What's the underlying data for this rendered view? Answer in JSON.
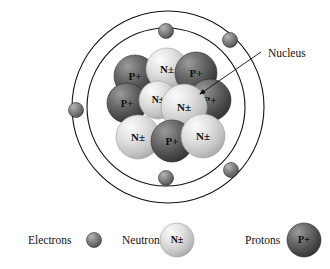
{
  "figure": {
    "background_color": "#ffffff",
    "ring_stroke_color": "#111111"
  },
  "annotations": {
    "nucleus_label": "Nucleus"
  },
  "colors": {
    "proton_light": "#8d8d8d",
    "proton_mid": "#636363",
    "proton_dark": "#3d3d3d",
    "neutron_light": "#f0f0f0",
    "neutron_mid": "#cfcfcf",
    "neutron_dark": "#9a9a9a",
    "electron_light": "#a8a8a8",
    "electron_mid": "#7c7c7c",
    "electron_dark": "#4a4a4a",
    "text": "#111111"
  },
  "orbits": [
    {
      "name": "outer-orbit",
      "cx": 168,
      "cy": 107,
      "r": 96
    },
    {
      "name": "inner-orbit",
      "cx": 166,
      "cy": 107,
      "r": 79
    }
  ],
  "electrons": [
    {
      "name": "electron-top-inner",
      "cx": 166,
      "cy": 31,
      "r": 7.5
    },
    {
      "name": "electron-top-right-outer",
      "cx": 230,
      "cy": 40,
      "r": 7.5
    },
    {
      "name": "electron-left-outer",
      "cx": 76,
      "cy": 110,
      "r": 7.5
    },
    {
      "name": "electron-bottom-inner",
      "cx": 166,
      "cy": 178,
      "r": 7.5
    },
    {
      "name": "electron-bottom-right-outer",
      "cx": 231,
      "cy": 170,
      "r": 7.5
    }
  ],
  "nucleus": {
    "particles": [
      {
        "name": "proton-1",
        "type": "proton",
        "label": "P+",
        "cx": 135,
        "cy": 76,
        "r": 21
      },
      {
        "name": "neutron-1",
        "type": "neutron",
        "label": "N±",
        "cx": 167,
        "cy": 69,
        "r": 21
      },
      {
        "name": "proton-2",
        "type": "proton",
        "label": "P+",
        "cx": 196,
        "cy": 73,
        "r": 21
      },
      {
        "name": "proton-3",
        "type": "proton",
        "label": "P+",
        "cx": 127,
        "cy": 103,
        "r": 20
      },
      {
        "name": "neutron-2",
        "type": "neutron",
        "label": "N±",
        "cx": 158,
        "cy": 100,
        "r": 19
      },
      {
        "name": "proton-4",
        "type": "proton",
        "label": "P+",
        "cx": 210,
        "cy": 100,
        "r": 21
      },
      {
        "name": "neutron-3",
        "type": "neutron",
        "label": "N±",
        "cx": 184,
        "cy": 107,
        "r": 23
      },
      {
        "name": "neutron-4",
        "type": "neutron",
        "label": "N±",
        "cx": 138,
        "cy": 137,
        "r": 22
      },
      {
        "name": "proton-5",
        "type": "proton",
        "label": "P+",
        "cx": 172,
        "cy": 141,
        "r": 21
      },
      {
        "name": "neutron-5",
        "type": "neutron",
        "label": "N±",
        "cx": 203,
        "cy": 136,
        "r": 22
      }
    ],
    "proton_count": 5,
    "neutron_count": 5
  },
  "leader_line": {
    "name": "nucleus-leader-line",
    "x1": 261,
    "y1": 52,
    "x2": 200,
    "y2": 94
  },
  "legend": {
    "items": [
      {
        "name": "legend-electrons",
        "label": "Electrons",
        "label_x": 28,
        "label_y": 244,
        "swatch": {
          "type": "electron",
          "cx": 94,
          "cy": 240,
          "r": 7.5,
          "glyph": ""
        }
      },
      {
        "name": "legend-neutrons",
        "label": "Neutrons",
        "label_x": 122,
        "label_y": 244,
        "swatch": {
          "type": "neutron",
          "cx": 177,
          "cy": 240,
          "r": 17,
          "glyph": "N±"
        }
      },
      {
        "name": "legend-protons",
        "label": "Protons",
        "label_x": 245,
        "label_y": 244,
        "swatch": {
          "type": "proton",
          "cx": 304,
          "cy": 240,
          "r": 17,
          "glyph": "P+"
        }
      }
    ]
  }
}
